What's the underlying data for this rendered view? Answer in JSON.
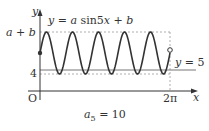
{
  "figure": {
    "equation_label": "y = a sin5x + b",
    "eq_parts": {
      "y": "y",
      "eq": " = ",
      "a": "a",
      "sin": " sin5",
      "x": "x",
      "plus": " + ",
      "b": "b"
    },
    "y_axis_label": "y",
    "x_axis_label": "x",
    "origin_label": "O",
    "max_label": "a + b",
    "max_parts": {
      "a": "a",
      "plus": " + ",
      "b": "b"
    },
    "min_label": "4",
    "line_label": "y = 5",
    "line_parts": {
      "y": "y",
      "eq": " = 5"
    },
    "x_end_label": "2π",
    "answer_label": "a₅ = 10",
    "answer_parts": {
      "a": "a",
      "sub": "5",
      "eq": " = 10"
    }
  },
  "chart_data": {
    "type": "line",
    "title": "y = a sin5x + b",
    "xlabel": "x",
    "ylabel": "y",
    "x_range": [
      "0",
      "2π"
    ],
    "periods": 5,
    "max": "a + b",
    "min": 4,
    "horizontal_line": {
      "label": "y = 5",
      "value": 5
    },
    "start_point": {
      "x": 0,
      "filled": true
    },
    "end_point": {
      "x": "2π",
      "filled": false
    },
    "annotation": "a₅ = 10",
    "colors": {
      "curve": "#333333",
      "guide": "#999999",
      "line": "#777777"
    }
  }
}
